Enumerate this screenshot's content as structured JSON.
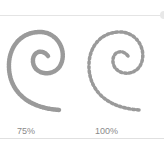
{
  "previews": [
    {
      "label": "75%",
      "spacing_percent": 75
    },
    {
      "label": "100%",
      "spacing_percent": 100
    }
  ],
  "colors": {
    "stroke": "#9a9a9a",
    "label": "#8a8a8a",
    "divider": "#e0e0e0"
  }
}
